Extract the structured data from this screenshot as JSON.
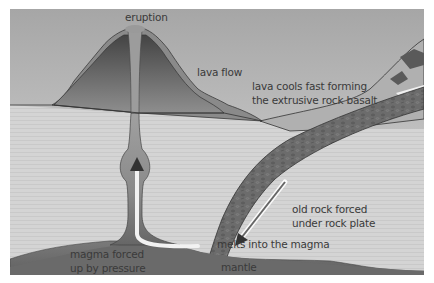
{
  "diagram": {
    "type": "volcano cross-section (subduction)",
    "colors": {
      "sky_top": "#a8a8a8",
      "sky_bottom": "#d8d8d8",
      "crust": "#d6d6d6",
      "crust_line": "#c8c8c8",
      "volcano_outer": "#8a8a8a",
      "volcano_inner_top": "#4a4a4a",
      "volcano_inner_bottom": "#8c8c8c",
      "magma_conduit": "#9a9a9a",
      "mantle": "#6e6e6e",
      "old_rock_plate": "#6a6a6a",
      "outline": "#333333",
      "arrow_fill": "#f2f2f2"
    },
    "labels": {
      "eruption": "eruption",
      "lava_flow": "lava flow",
      "lava_cools_line1": "lava cools fast forming",
      "lava_cools_line2": "the extrusive rock basalt",
      "old_rock_line1": "old rock forced",
      "old_rock_line2": "under rock plate",
      "melts": "melts into the magma",
      "mantle": "mantle",
      "magma_line1": "magma forced",
      "magma_line2": "up by pressure"
    }
  }
}
